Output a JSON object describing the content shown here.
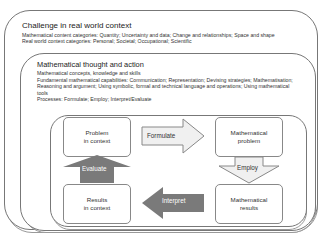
{
  "outer": {
    "title": "Challenge in real world context",
    "lines": "Mathematical content categories: Quantity; Uncertainty and data; Change and relationships; Space and shape\nReal world context categories: Personal; Societal; Occupational; Scientific"
  },
  "middle": {
    "title": "Mathematical thought and action",
    "lines": "Mathematical concepts, knowledge and skills\nFundamental mathematical capabilities: Communication; Representation; Devising strategies; Mathematisation; Reasoning and argument; Using symbolic, formal and technical language and operations; Using mathematical tools\nProcesses: Formulate; Employ; Interpret/Evaluate"
  },
  "cycle": {
    "nodes": {
      "problem_context": [
        "Problem",
        "in context"
      ],
      "math_problem": [
        "Mathematical",
        "problem"
      ],
      "results_context": [
        "Results",
        "in context"
      ],
      "math_results": [
        "Mathematical",
        "results"
      ]
    },
    "arrows": {
      "formulate": "Formulate",
      "employ": "Employ",
      "interpret": "Interpret",
      "evaluate": "Evaluate"
    },
    "colors": {
      "light_arrow": "#f0f0f0",
      "dark_arrow": "#7a7a7a"
    }
  }
}
